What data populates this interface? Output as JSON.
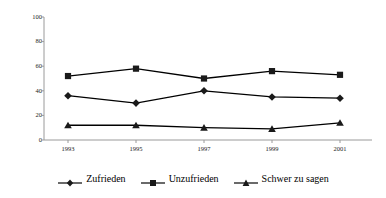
{
  "chart_data": {
    "type": "line",
    "title": "",
    "subtitle": "",
    "xlabel": "",
    "ylabel": "",
    "categories": [
      "1993",
      "1995",
      "1997",
      "1999",
      "2001"
    ],
    "x": [
      1993,
      1995,
      1997,
      1999,
      2001
    ],
    "ylim": [
      0,
      100
    ],
    "yticks": [
      0,
      20,
      40,
      60,
      80,
      100
    ],
    "ytick_labels": [
      "0",
      "20",
      "40",
      "60",
      "80",
      "100"
    ],
    "grid": false,
    "legend_position": "bottom",
    "series": [
      {
        "name": "Zufrieden",
        "marker": "diamond",
        "color": "#000000",
        "values": [
          36,
          30,
          40,
          35,
          34
        ]
      },
      {
        "name": "Unzufrieden",
        "marker": "square",
        "color": "#000000",
        "values": [
          52,
          58,
          50,
          56,
          53
        ]
      },
      {
        "name": "Schwer zu sagen",
        "marker": "triangle",
        "color": "#000000",
        "values": [
          12,
          12,
          10,
          9,
          14
        ]
      }
    ]
  },
  "axes": {
    "y_tick_labels": [
      "100",
      "80",
      "60",
      "40",
      "20",
      "0"
    ],
    "x_tick_labels": [
      "1993",
      "1995",
      "1997",
      "1999",
      "2001"
    ]
  },
  "legend": {
    "items": [
      {
        "label": "Zufrieden",
        "marker": "diamond-marker-icon"
      },
      {
        "label": "Unzufrieden",
        "marker": "square-marker-icon"
      },
      {
        "label": "Schwer zu sagen",
        "marker": "triangle-marker-icon"
      }
    ]
  },
  "colors": {
    "line": "#1a1a1a",
    "axis": "#9a9a9a",
    "text": "#111111",
    "background": "#ffffff"
  }
}
